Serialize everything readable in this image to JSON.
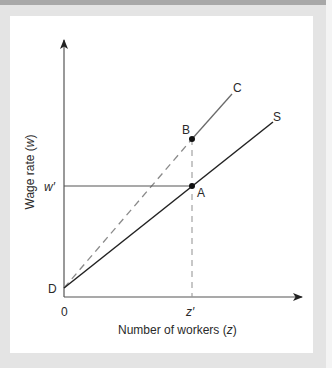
{
  "figure": {
    "type": "economics-diagram",
    "axes": {
      "y_label": "Wage rate (w)",
      "y_label_main": "Wage rate (",
      "y_label_var": "w",
      "y_label_close": ")",
      "x_label_main": "Number of workers (",
      "x_label_var": "z",
      "x_label_close": ")",
      "origin_label": "0"
    },
    "ticks": {
      "w_prime": "w′",
      "z_prime": "z′"
    },
    "points": {
      "D": "D",
      "A": "A",
      "B": "B"
    },
    "curves": {
      "S": "S",
      "C": "C"
    },
    "colors": {
      "axis": "#3a3a3a",
      "supply_line": "#222222",
      "cost_line": "#6a6a6a",
      "dashed": "#9a9a9a",
      "panel": "#ffffff",
      "frame": "#e4e4e4"
    }
  }
}
